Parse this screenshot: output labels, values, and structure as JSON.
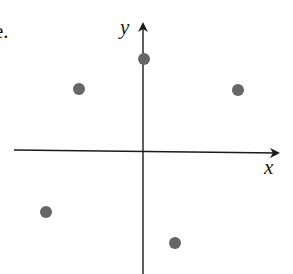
{
  "text_fragment": "e.",
  "axes": {
    "x_label": "x",
    "y_label": "y",
    "origin_px": [
      143,
      150
    ],
    "axis_color": "#1a1a1a"
  },
  "points": {
    "color": "#666666",
    "radius": 6,
    "items": [
      {
        "label": "on positive y-axis",
        "px": [
          144,
          59
        ]
      },
      {
        "label": "quadrant II",
        "px": [
          79,
          89
        ]
      },
      {
        "label": "quadrant I",
        "px": [
          238,
          90
        ]
      },
      {
        "label": "quadrant III",
        "px": [
          46,
          212
        ]
      },
      {
        "label": "quadrant IV",
        "px": [
          175,
          243
        ]
      }
    ]
  },
  "chart_data": {
    "type": "scatter",
    "title": "",
    "xlabel": "x",
    "ylabel": "y",
    "grid": false,
    "legend": null,
    "ticks": "none",
    "points_relative_to_origin_px": [
      {
        "x": 1,
        "y": 91
      },
      {
        "x": -64,
        "y": 61
      },
      {
        "x": 95,
        "y": 60
      },
      {
        "x": -97,
        "y": -62
      },
      {
        "x": 32,
        "y": -93
      }
    ]
  }
}
